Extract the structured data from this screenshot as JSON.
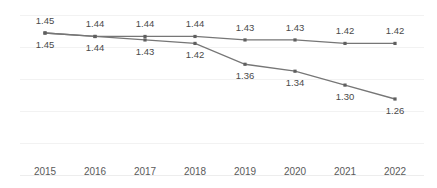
{
  "chart_data": {
    "type": "line",
    "title": "",
    "subtitle": "",
    "xlabel": "",
    "ylabel": "",
    "grid": true,
    "legend": "none",
    "categories": [
      "2015",
      "2016",
      "2017",
      "2018",
      "2019",
      "2020",
      "2021",
      "2022"
    ],
    "ylim": [
      1.2,
      1.47
    ],
    "series": [
      {
        "name": "upper-series",
        "label_position": "above",
        "color": "#767676",
        "values": [
          1.45,
          1.44,
          1.44,
          1.44,
          1.43,
          1.43,
          1.42,
          1.42
        ],
        "labels": [
          "1.45",
          "1.44",
          "1.44",
          "1.44",
          "1.43",
          "1.43",
          "1.42",
          "1.42"
        ]
      },
      {
        "name": "lower-series",
        "label_position": "below",
        "color": "#767676",
        "values": [
          1.45,
          1.44,
          1.43,
          1.42,
          1.36,
          1.34,
          1.3,
          1.26
        ],
        "labels": [
          "1.45",
          "1.44",
          "1.43",
          "1.42",
          "1.36",
          "1.34",
          "1.30",
          "1.26"
        ]
      }
    ],
    "gridline_color": "#f2f2f2",
    "axis_color": "#ededed",
    "tick_label_color": "#5a5a5a",
    "data_label_color": "#4a4a4a"
  }
}
